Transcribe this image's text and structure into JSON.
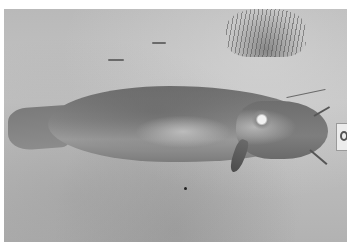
{
  "image": {
    "description": "Black-and-white photograph of a large catfish lying on sandy ground, with a small tuft of grass at top and a scale/label card near the fish's head",
    "subjects": [
      "catfish",
      "sand",
      "grass tuft",
      "scale card"
    ],
    "colors": {
      "border": "#ffffff",
      "sand": "#bdbdbd",
      "fish": "#7e7e7e",
      "shadow": "#555555"
    }
  }
}
